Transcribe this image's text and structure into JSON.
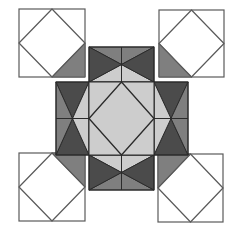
{
  "figure": {
    "colors": {
      "background": "#ffffff",
      "light": "#cdcdcd",
      "medium": "#7f7f7f",
      "dark": "#4b4b4b",
      "outline": "#2b2b2b",
      "corner_outline": "#5a5a5a"
    },
    "corner_blocks": [
      {
        "name": "top-left",
        "x": 19,
        "y": 9,
        "w": 66,
        "h": 68,
        "accent_corner": "bottom-right"
      },
      {
        "name": "top-right",
        "x": 159,
        "y": 10,
        "w": 65,
        "h": 67,
        "accent_corner": "bottom-left"
      },
      {
        "name": "bottom-left",
        "x": 19,
        "y": 153,
        "w": 66,
        "h": 68,
        "accent_corner": "top-right"
      },
      {
        "name": "bottom-right",
        "x": 158,
        "y": 154,
        "w": 65,
        "h": 68,
        "accent_corner": "top-left"
      }
    ],
    "side_blocks": [
      {
        "name": "top",
        "x": 89,
        "y": 47,
        "w": 65,
        "h": 35,
        "orientation": "horizontal",
        "outer": "top"
      },
      {
        "name": "bottom",
        "x": 89,
        "y": 155,
        "w": 65,
        "h": 35,
        "orientation": "horizontal",
        "outer": "bottom"
      },
      {
        "name": "left",
        "x": 56,
        "y": 82,
        "w": 33,
        "h": 73,
        "orientation": "vertical",
        "outer": "left"
      },
      {
        "name": "right",
        "x": 154,
        "y": 82,
        "w": 34,
        "h": 73,
        "orientation": "vertical",
        "outer": "right"
      }
    ],
    "center_block": {
      "x": 89,
      "y": 82,
      "w": 65,
      "h": 73
    }
  }
}
